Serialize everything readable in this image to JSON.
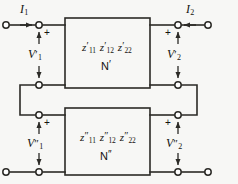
{
  "diagram": {
    "colors": {
      "background": "#f7f7f5",
      "line": "#2b2a26",
      "text": "#14130f",
      "node_fill": "#ffffff"
    },
    "currents": [
      {
        "name": "I1",
        "label": "I",
        "sub": "1",
        "direction": "right"
      },
      {
        "name": "I2",
        "label": "I",
        "sub": "2",
        "direction": "left"
      }
    ],
    "voltages": [
      {
        "name": "V1-prime",
        "label": "V",
        "sub": "1",
        "prime": "′",
        "polarity": "+"
      },
      {
        "name": "V2-prime",
        "label": "V",
        "sub": "2",
        "prime": "′",
        "polarity": "+"
      },
      {
        "name": "V1-doubleprime",
        "label": "V",
        "sub": "1",
        "prime": "″",
        "polarity": "+"
      },
      {
        "name": "V2-doubleprime",
        "label": "V",
        "sub": "2",
        "prime": "″",
        "polarity": "+"
      }
    ],
    "networks": [
      {
        "name": "N-prime",
        "label": "N",
        "prime": "′",
        "parameters": [
          {
            "symbol": "z",
            "sub": "11",
            "prime": "′"
          },
          {
            "symbol": "z",
            "sub": "12",
            "prime": "′"
          },
          {
            "symbol": "z",
            "sub": "22",
            "prime": "′"
          }
        ]
      },
      {
        "name": "N-doubleprime",
        "label": "N",
        "prime": "″",
        "parameters": [
          {
            "symbol": "z",
            "sub": "11",
            "prime": "″"
          },
          {
            "symbol": "z",
            "sub": "12",
            "prime": "″"
          },
          {
            "symbol": "z",
            "sub": "22",
            "prime": "″"
          }
        ]
      }
    ]
  }
}
